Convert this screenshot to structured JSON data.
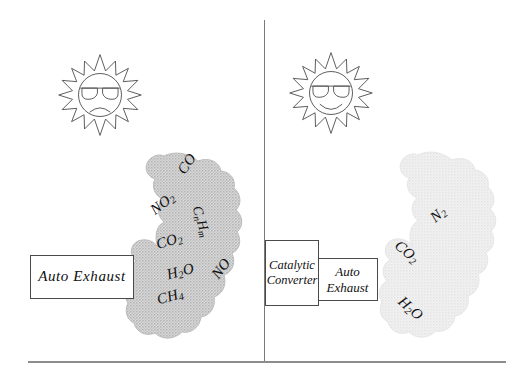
{
  "figure": {
    "type": "diagram",
    "panels": [
      {
        "id": "left-panel",
        "sun_mood": "frowning",
        "source_box": "Auto Exhaust",
        "emissions": [
          "CO",
          "NO2",
          "CnHm",
          "CO2",
          "H2O",
          "NO",
          "CH4"
        ]
      },
      {
        "id": "right-panel",
        "sun_mood": "smiling",
        "source_box": "Auto Exhaust",
        "device_box": "Catalytic Converter",
        "emissions": [
          "N2",
          "CO2",
          "H2O"
        ]
      }
    ]
  },
  "boxes": {
    "auto_exhaust_left": "Auto  Exhaust",
    "catalytic_converter_line1": "Catalytic",
    "catalytic_converter_line2": "Converter",
    "auto_exhaust_right_line1": "Auto",
    "auto_exhaust_right_line2": "Exhaust"
  },
  "left_plume": {
    "labels": [
      {
        "id": "co",
        "text": "CO",
        "sub": "",
        "post": ""
      },
      {
        "id": "no2",
        "text": "NO",
        "sub": "2",
        "post": ""
      },
      {
        "id": "cnhm",
        "text": "C",
        "sub": "n",
        "post": "H"
      },
      {
        "id": "cnhm_tail",
        "text": "m"
      },
      {
        "id": "co2",
        "text": "CO",
        "sub": "2",
        "post": ""
      },
      {
        "id": "h2o",
        "text": "H",
        "sub": "2",
        "post": "O"
      },
      {
        "id": "no",
        "text": "NO",
        "sub": "",
        "post": ""
      },
      {
        "id": "ch4",
        "text": "CH",
        "sub": "4",
        "post": ""
      }
    ]
  },
  "right_plume": {
    "labels": [
      {
        "id": "n2",
        "text": "N",
        "sub": "2",
        "post": ""
      },
      {
        "id": "co2",
        "text": "CO",
        "sub": "2",
        "post": ""
      },
      {
        "id": "h2o",
        "text": "H",
        "sub": "2",
        "post": "O"
      }
    ]
  },
  "colors": {
    "plume_left_fill": "#cfcfcf",
    "plume_right_fill": "#ededed",
    "line": "#4a4a4a",
    "rule": "#8c8c8c",
    "text": "#111111",
    "background": "#ffffff"
  }
}
